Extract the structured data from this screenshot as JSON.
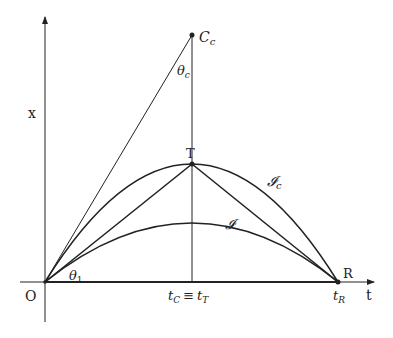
{
  "diagram": {
    "axes": {
      "horizontal_label": "t",
      "vertical_label": "x",
      "origin_label": "O"
    },
    "points": {
      "T": "T",
      "R": "R",
      "C_c_main": "C",
      "C_c_sub": "c"
    },
    "angles": {
      "theta_c_main": "θ",
      "theta_c_sub": "c",
      "theta_1_main": "θ",
      "theta_1_sub": "1"
    },
    "curves": {
      "outer_main": "𝓘",
      "outer_sub": "c",
      "inner": "𝓘"
    },
    "tick_labels": {
      "tC_main": "t",
      "tC_sub": "C",
      "equiv": "≡",
      "tT_main": "t",
      "tT_sub": "T",
      "tR_main": "t",
      "tR_sub": "R"
    },
    "colors": {
      "line": "#222222",
      "background": "#ffffff"
    }
  }
}
